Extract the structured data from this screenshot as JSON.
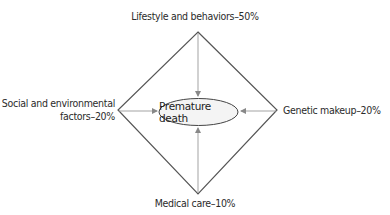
{
  "diagram": {
    "center": {
      "label": "Premature death",
      "shape": "ellipse"
    },
    "factors": [
      {
        "position": "top",
        "label": "Lifestyle and behaviors–50%",
        "name": "Lifestyle and behaviors",
        "percent": 50
      },
      {
        "position": "right",
        "label": "Genetic makeup–20%",
        "name": "Genetic makeup",
        "percent": 20
      },
      {
        "position": "bottom",
        "label": "Medical care–10%",
        "name": "Medical care",
        "percent": 10
      },
      {
        "position": "left",
        "label_line1": "Social and environmental",
        "label_line2": "factors–20%",
        "name": "Social and environmental factors",
        "percent": 20
      }
    ],
    "colors": {
      "lines": "#555555",
      "arrows": "#888888",
      "text": "#2b2b2b",
      "ellipse_fill": "#f4f4f4"
    }
  }
}
